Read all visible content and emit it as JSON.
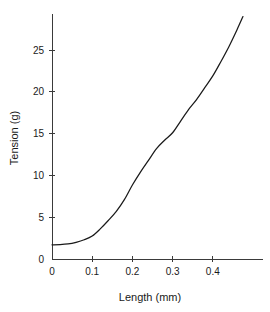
{
  "chart_data": {
    "type": "line",
    "title": "",
    "subtitle": "",
    "xlabel": "Length (mm)",
    "ylabel": "Tension (g)",
    "xlim": [
      0,
      0.475
    ],
    "ylim": [
      0,
      29.2
    ],
    "grid": false,
    "legend": null,
    "legend_position": "none",
    "xticks": [
      0,
      0.1,
      0.2,
      0.3,
      0.4
    ],
    "xticklabels": [
      "0",
      "0.1",
      "0.2",
      "0.3",
      "0.4"
    ],
    "yticks": [
      0,
      5,
      10,
      15,
      20,
      25
    ],
    "yticklabels": [
      "0",
      "5",
      "10",
      "15",
      "20",
      "25"
    ],
    "series": [
      {
        "name": "Tension vs Length",
        "color": "#1a1a1a",
        "x": [
          0.0,
          0.02,
          0.04,
          0.06,
          0.08,
          0.1,
          0.12,
          0.14,
          0.16,
          0.18,
          0.2,
          0.22,
          0.24,
          0.26,
          0.28,
          0.3,
          0.32,
          0.34,
          0.36,
          0.38,
          0.4,
          0.42,
          0.44,
          0.46,
          0.475
        ],
        "y": [
          1.7,
          1.72,
          1.8,
          2.0,
          2.3,
          2.75,
          3.6,
          4.6,
          5.7,
          7.1,
          8.85,
          10.4,
          11.8,
          13.2,
          14.2,
          15.1,
          16.5,
          17.9,
          19.1,
          20.5,
          21.9,
          23.6,
          25.4,
          27.4,
          29.0
        ]
      }
    ],
    "annotations": []
  },
  "axes": {
    "y_axis_title": "Tension (g)",
    "x_axis_title": "Length (mm)"
  },
  "colors": {
    "curve": "#1a1a1a",
    "axis": "#3a3a3a",
    "background": "#ffffff",
    "text": "#1a1a1a"
  }
}
